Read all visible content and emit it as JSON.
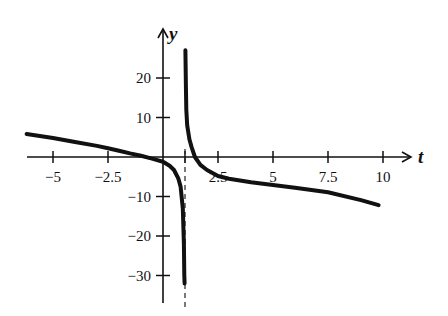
{
  "chart_data": {
    "type": "line",
    "title": "",
    "xlabel": "t",
    "ylabel": "y",
    "xlim": [
      -6.2,
      11.2
    ],
    "ylim": [
      -37,
      30
    ],
    "grid": false,
    "legend": null,
    "x_ticks": [
      {
        "value": -5,
        "label": "-5"
      },
      {
        "value": -2.5,
        "label": "-2.5"
      },
      {
        "value": 1,
        "label": ""
      },
      {
        "value": 2.5,
        "label": "2.5"
      },
      {
        "value": 5,
        "label": "5"
      },
      {
        "value": 7.5,
        "label": "7.5"
      },
      {
        "value": 10,
        "label": "10"
      }
    ],
    "y_ticks": [
      {
        "value": 20,
        "label": "20"
      },
      {
        "value": 10,
        "label": "10"
      },
      {
        "value": -10,
        "label": "-10"
      },
      {
        "value": -20,
        "label": "-20"
      },
      {
        "value": -30,
        "label": "-30"
      }
    ],
    "annotations": [
      {
        "type": "vertical-asymptote",
        "x": 1,
        "style": "dashed"
      }
    ],
    "series": [
      {
        "name": "left-branch",
        "x": [
          -6.2,
          -5,
          -4,
          -3,
          -2.5,
          -2,
          -1.5,
          -1,
          -0.5,
          0,
          0.3,
          0.5,
          0.7,
          0.8,
          0.9,
          0.95,
          0.97,
          0.98
        ],
        "y": [
          5.8,
          4.8,
          3.8,
          2.8,
          2.2,
          1.6,
          0.9,
          0.3,
          -0.4,
          -1.2,
          -2.2,
          -3.3,
          -5.5,
          -7.5,
          -13,
          -22,
          -30,
          -32
        ]
      },
      {
        "name": "right-branch",
        "x": [
          1.02,
          1.04,
          1.06,
          1.1,
          1.2,
          1.3,
          1.45,
          1.7,
          2,
          2.5,
          3,
          4,
          5,
          6,
          7.5,
          9,
          9.8
        ],
        "y": [
          27,
          18,
          12,
          8,
          4.5,
          2.5,
          0,
          -2,
          -3.3,
          -4.8,
          -5.5,
          -6.4,
          -7.1,
          -7.8,
          -8.9,
          -10.9,
          -12.2
        ]
      }
    ]
  }
}
